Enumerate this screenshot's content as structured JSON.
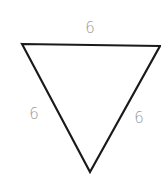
{
  "diagram": {
    "type": "equilateral-triangle",
    "orientation": "pointing-down",
    "stroke_color": "#1a1a1a",
    "label_color": "#9a9a9a",
    "vertices": {
      "top_left": [
        22,
        44
      ],
      "top_right": [
        160,
        46
      ],
      "bottom": [
        90,
        172
      ]
    },
    "sides": [
      {
        "name": "top",
        "label": "6"
      },
      {
        "name": "left",
        "label": "6"
      },
      {
        "name": "right",
        "label": "6"
      }
    ]
  }
}
